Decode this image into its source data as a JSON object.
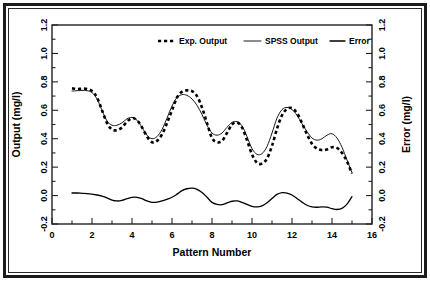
{
  "chart_data": {
    "type": "line",
    "title": "",
    "xlabel": "Pattern Number",
    "ylabel": "Output (mg/l)",
    "y2label": "Error (mg/l)",
    "xlim": [
      0,
      16
    ],
    "ylim": [
      -0.2,
      1.2
    ],
    "y2lim": [
      -0.2,
      1.2
    ],
    "xticks": [
      0,
      2,
      4,
      6,
      8,
      10,
      12,
      14,
      16
    ],
    "xtick_labels": [
      "0",
      "2",
      "4",
      "6",
      "8",
      "10",
      "12",
      "14",
      "16"
    ],
    "xminor_step": 1,
    "yticks": [
      -0.2,
      0.0,
      0.2,
      0.4,
      0.6,
      0.8,
      1.0,
      1.2
    ],
    "ytick_labels": [
      "-0.2",
      "0.0",
      "0.2",
      "0.4",
      "0.6",
      "0.8",
      "1.0",
      "1.2"
    ],
    "yminor_step": 0.1,
    "y2ticks": [
      -0.2,
      0.0,
      0.2,
      0.4,
      0.6,
      0.8,
      1.0,
      1.2
    ],
    "y2tick_labels": [
      "-0.2",
      "0.0",
      "0.2",
      "0.4",
      "0.6",
      "0.8",
      "1.0",
      "1.2"
    ],
    "grid": false,
    "legend_position": "top-center",
    "series": [
      {
        "name": "Exp. Output",
        "style": "dashed",
        "axis": "left",
        "color": "#000000",
        "x": [
          1.0,
          1.25,
          1.5,
          1.75,
          2.0,
          2.25,
          2.5,
          2.75,
          3.0,
          3.25,
          3.5,
          3.75,
          4.0,
          4.25,
          4.5,
          4.75,
          5.0,
          5.25,
          5.5,
          5.75,
          6.0,
          6.25,
          6.5,
          6.75,
          7.0,
          7.25,
          7.5,
          7.75,
          8.0,
          8.25,
          8.5,
          8.75,
          9.0,
          9.25,
          9.5,
          9.75,
          10.0,
          10.25,
          10.5,
          10.75,
          11.0,
          11.25,
          11.5,
          11.75,
          12.0,
          12.25,
          12.5,
          12.75,
          13.0,
          13.25,
          13.5,
          13.75,
          14.0,
          14.25,
          14.5,
          14.75,
          15.0
        ],
        "y": [
          0.755,
          0.75,
          0.752,
          0.75,
          0.735,
          0.69,
          0.6,
          0.51,
          0.465,
          0.46,
          0.48,
          0.52,
          0.545,
          0.53,
          0.48,
          0.415,
          0.375,
          0.385,
          0.43,
          0.51,
          0.6,
          0.69,
          0.73,
          0.74,
          0.735,
          0.7,
          0.62,
          0.51,
          0.405,
          0.375,
          0.385,
          0.44,
          0.5,
          0.515,
          0.48,
          0.39,
          0.29,
          0.23,
          0.225,
          0.26,
          0.35,
          0.47,
          0.565,
          0.61,
          0.615,
          0.58,
          0.51,
          0.43,
          0.365,
          0.33,
          0.32,
          0.325,
          0.34,
          0.335,
          0.3,
          0.24,
          0.155
        ]
      },
      {
        "name": "SPSS Output",
        "style": "thin-solid",
        "axis": "left",
        "color": "#000000",
        "x": [
          1.0,
          1.25,
          1.5,
          1.75,
          2.0,
          2.25,
          2.5,
          2.75,
          3.0,
          3.25,
          3.5,
          3.75,
          4.0,
          4.25,
          4.5,
          4.75,
          5.0,
          5.25,
          5.5,
          5.75,
          6.0,
          6.25,
          6.5,
          6.75,
          7.0,
          7.25,
          7.5,
          7.75,
          8.0,
          8.25,
          8.5,
          8.75,
          9.0,
          9.25,
          9.5,
          9.75,
          10.0,
          10.25,
          10.5,
          10.75,
          11.0,
          11.25,
          11.5,
          11.75,
          12.0,
          12.25,
          12.5,
          12.75,
          13.0,
          13.25,
          13.5,
          13.75,
          14.0,
          14.25,
          14.5,
          14.75,
          15.0
        ],
        "y": [
          0.735,
          0.738,
          0.74,
          0.738,
          0.725,
          0.68,
          0.6,
          0.525,
          0.495,
          0.495,
          0.512,
          0.54,
          0.55,
          0.53,
          0.48,
          0.425,
          0.4,
          0.415,
          0.465,
          0.545,
          0.63,
          0.69,
          0.71,
          0.705,
          0.68,
          0.635,
          0.57,
          0.495,
          0.44,
          0.425,
          0.44,
          0.48,
          0.515,
          0.52,
          0.49,
          0.415,
          0.33,
          0.29,
          0.295,
          0.345,
          0.44,
          0.545,
          0.605,
          0.62,
          0.605,
          0.565,
          0.505,
          0.45,
          0.405,
          0.39,
          0.4,
          0.425,
          0.435,
          0.405,
          0.34,
          0.25,
          0.16
        ]
      },
      {
        "name": "Error",
        "style": "solid",
        "axis": "right",
        "color": "#000000",
        "x": [
          1.0,
          1.25,
          1.5,
          1.75,
          2.0,
          2.25,
          2.5,
          2.75,
          3.0,
          3.25,
          3.5,
          3.75,
          4.0,
          4.25,
          4.5,
          4.75,
          5.0,
          5.25,
          5.5,
          5.75,
          6.0,
          6.25,
          6.5,
          6.75,
          7.0,
          7.25,
          7.5,
          7.75,
          8.0,
          8.25,
          8.5,
          8.75,
          9.0,
          9.25,
          9.5,
          9.75,
          10.0,
          10.25,
          10.5,
          10.75,
          11.0,
          11.25,
          11.5,
          11.75,
          12.0,
          12.25,
          12.5,
          12.75,
          13.0,
          13.25,
          13.5,
          13.75,
          14.0,
          14.25,
          14.5,
          14.75,
          15.0
        ],
        "y": [
          0.018,
          0.018,
          0.016,
          0.014,
          0.01,
          0.004,
          -0.004,
          -0.016,
          -0.032,
          -0.038,
          -0.034,
          -0.022,
          -0.012,
          -0.012,
          -0.022,
          -0.038,
          -0.048,
          -0.046,
          -0.038,
          -0.026,
          -0.012,
          0.01,
          0.035,
          0.048,
          0.052,
          0.044,
          0.022,
          -0.012,
          -0.048,
          -0.062,
          -0.064,
          -0.052,
          -0.04,
          -0.038,
          -0.048,
          -0.062,
          -0.076,
          -0.08,
          -0.072,
          -0.05,
          -0.02,
          0.008,
          0.02,
          0.018,
          0.004,
          -0.02,
          -0.046,
          -0.068,
          -0.08,
          -0.082,
          -0.08,
          -0.082,
          -0.092,
          -0.098,
          -0.09,
          -0.06,
          -0.008
        ]
      }
    ]
  },
  "legend": {
    "items": [
      {
        "label": "Exp. Output",
        "style": "dashed"
      },
      {
        "label": "SPSS Output",
        "style": "thin-solid"
      },
      {
        "label": "Error",
        "style": "solid"
      }
    ]
  }
}
